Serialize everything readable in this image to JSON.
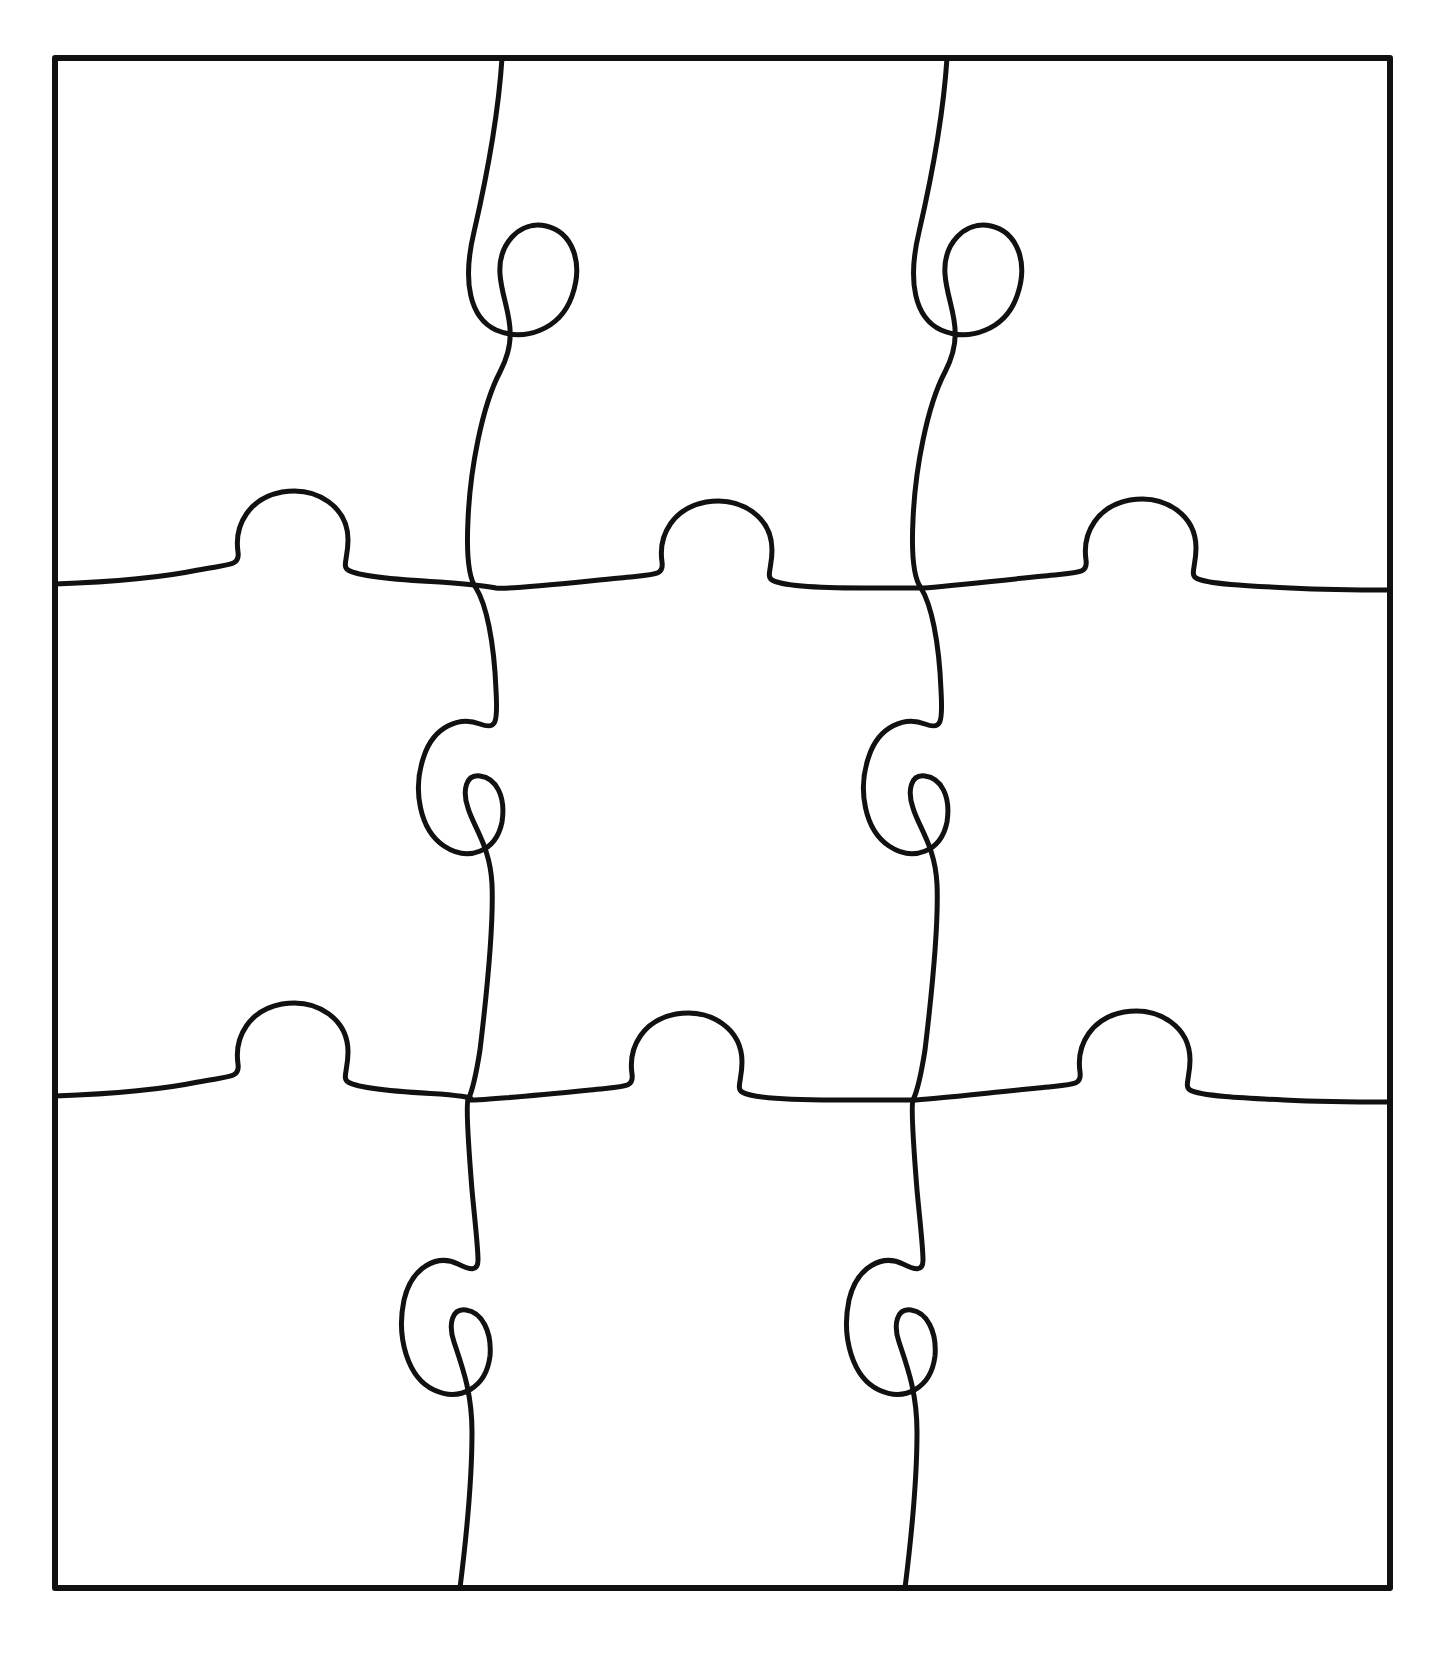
{
  "document": {
    "title": "Blank Jigsaw Puzzle Template",
    "kind": "line-drawing",
    "background_color": "#ffffff",
    "stroke_color": "#111111"
  },
  "puzzle": {
    "name": "nine-piece-jigsaw-outline",
    "rows": 3,
    "columns": 3,
    "piece_count": 9,
    "border": {
      "name": "outer-frame",
      "shape": "rectangle",
      "left": 55,
      "top": 58,
      "right": 1390,
      "bottom": 1588,
      "stroke_width": 6,
      "stroke_color": "#111111",
      "fill": "none"
    },
    "seam_stroke_width": 5,
    "vertical_seams": [
      {
        "name": "vertical-seam-left",
        "index": 0,
        "top_x": 502,
        "bottom_x": 460,
        "knob_directions": [
          "right",
          "left",
          "right"
        ],
        "knob_centers_y": [
          295,
          785,
          1275
        ]
      },
      {
        "name": "vertical-seam-right",
        "index": 1,
        "top_x": 947,
        "bottom_x": 900,
        "knob_directions": [
          "right",
          "left",
          "right"
        ],
        "knob_centers_y": [
          295,
          785,
          1275
        ]
      }
    ],
    "horizontal_seams": [
      {
        "name": "horizontal-seam-top",
        "index": 0,
        "left_y": 584,
        "right_y": 590,
        "knob_directions": [
          "up",
          "up",
          "up"
        ],
        "knob_centers_x": [
          265,
          690,
          1115
        ]
      },
      {
        "name": "horizontal-seam-bottom",
        "index": 1,
        "left_y": 1096,
        "right_y": 1100,
        "knob_directions": [
          "up",
          "up",
          "up"
        ],
        "knob_centers_x": [
          265,
          690,
          1115
        ]
      }
    ],
    "pieces": [
      {
        "name": "piece-row1-col1",
        "row": 1,
        "column": 1,
        "label": ""
      },
      {
        "name": "piece-row1-col2",
        "row": 1,
        "column": 2,
        "label": ""
      },
      {
        "name": "piece-row1-col3",
        "row": 1,
        "column": 3,
        "label": ""
      },
      {
        "name": "piece-row2-col1",
        "row": 2,
        "column": 1,
        "label": ""
      },
      {
        "name": "piece-row2-col2",
        "row": 2,
        "column": 2,
        "label": ""
      },
      {
        "name": "piece-row2-col3",
        "row": 2,
        "column": 3,
        "label": ""
      },
      {
        "name": "piece-row3-col1",
        "row": 3,
        "column": 1,
        "label": ""
      },
      {
        "name": "piece-row3-col2",
        "row": 3,
        "column": 2,
        "label": ""
      },
      {
        "name": "piece-row3-col3",
        "row": 3,
        "column": 3,
        "label": ""
      }
    ]
  },
  "geometry": {
    "frame_path": "M 55 58 L 1390 58 L 1390 1588 L 55 1588 Z",
    "vertical_seam_left_path": "M 502 58 C 498 120 486 180 474 232 C 462 282 470 318 496 330 C 524 342 560 330 572 296 C 584 262 572 232 546 226 C 520 220 498 244 500 274 C 502 306 522 330 500 372 C 482 406 470 470 468 520 C 466 560 470 580 476 588 C 486 604 494 640 496 690 C 498 724 496 730 480 724 C 460 716 434 726 424 756 C 412 790 420 830 444 846 C 468 862 496 852 502 822 C 506 796 496 778 480 776 C 466 774 462 790 468 808 C 474 828 490 846 492 884 C 494 930 486 1000 480 1050 C 474 1088 470 1096 468 1100 C 466 1106 468 1140 472 1190 C 476 1232 478 1248 478 1260 C 478 1272 470 1270 458 1264 C 438 1254 412 1266 404 1300 C 396 1338 408 1378 434 1390 C 460 1402 486 1388 490 1356 C 492 1332 482 1312 466 1310 C 452 1308 448 1324 454 1342 C 462 1366 472 1392 472 1432 C 472 1480 466 1540 460 1588",
    "vertical_seam_right_path": "M 947 58 C 943 120 931 180 919 232 C 907 282 915 318 941 330 C 969 342 1005 330 1017 296 C 1029 262 1017 232 991 226 C 965 220 943 244 945 274 C 947 306 967 330 945 372 C 927 406 915 470 913 520 C 911 560 915 580 921 588 C 931 604 939 640 941 690 C 943 724 941 730 925 724 C 905 716 879 726 869 756 C 857 790 865 830 889 846 C 913 862 941 852 947 822 C 951 796 941 778 925 776 C 911 774 907 790 913 808 C 919 828 935 846 937 884 C 939 930 931 1000 925 1050 C 919 1088 915 1096 913 1100 C 911 1106 913 1140 917 1190 C 921 1232 923 1248 923 1260 C 923 1272 915 1270 903 1264 C 883 1254 857 1266 849 1300 C 841 1338 853 1378 879 1390 C 905 1402 931 1388 935 1356 C 937 1332 927 1312 911 1310 C 897 1308 893 1324 899 1342 C 907 1366 917 1392 917 1432 C 917 1480 911 1540 905 1588",
    "horizontal_seam_top_path": "M 55 584 C 110 582 160 578 198 570 C 230 564 240 566 238 552 C 234 524 250 498 282 492 C 318 486 348 508 348 540 C 348 558 342 566 348 570 C 358 576 400 580 440 582 C 468 584 486 586 496 588 C 508 590 560 584 620 578 C 656 574 664 576 662 562 C 658 534 674 508 706 502 C 742 496 772 518 772 550 C 772 568 766 576 772 580 C 782 586 824 588 864 588 C 892 588 910 588 921 588 C 932 588 984 582 1044 576 C 1080 572 1088 574 1086 560 C 1082 532 1098 506 1130 500 C 1166 494 1196 516 1196 548 C 1196 566 1190 574 1196 578 C 1206 584 1248 586 1290 588 C 1332 590 1368 590 1390 590",
    "horizontal_seam_bottom_path": "M 55 1096 C 110 1094 160 1090 198 1082 C 230 1076 240 1078 238 1064 C 234 1036 250 1010 282 1004 C 318 998 348 1020 348 1052 C 348 1070 342 1078 348 1082 C 358 1088 400 1092 440 1094 C 462 1096 478 1098 468 1100 C 478 1100 530 1096 590 1090 C 626 1086 634 1088 632 1074 C 628 1046 644 1020 676 1014 C 712 1008 742 1030 742 1062 C 742 1080 736 1088 742 1092 C 752 1098 794 1100 834 1100 C 870 1100 900 1100 913 1100 C 926 1100 978 1094 1038 1088 C 1074 1084 1082 1086 1080 1072 C 1076 1044 1092 1018 1124 1012 C 1160 1006 1190 1028 1190 1060 C 1190 1078 1184 1086 1190 1090 C 1200 1096 1242 1098 1284 1100 C 1326 1102 1368 1102 1390 1102"
  }
}
